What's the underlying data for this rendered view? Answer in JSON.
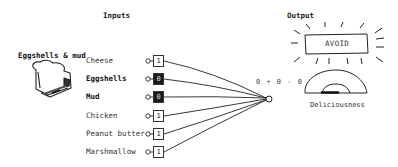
{
  "inputs_panel": {
    "heading": "Inputs",
    "sandwich_title": "Eggshells & mud",
    "sandwich_icon": "sandwich-icon",
    "items": [
      {
        "label": "Cheese",
        "value": "1",
        "active": false,
        "emphasized": false
      },
      {
        "label": "Eggshells",
        "value": "0",
        "active": true,
        "emphasized": true
      },
      {
        "label": "Mud",
        "value": "0",
        "active": true,
        "emphasized": true
      },
      {
        "label": "Chicken",
        "value": "1",
        "active": false,
        "emphasized": false
      },
      {
        "label": "Peanut butter",
        "value": "1",
        "active": false,
        "emphasized": false
      },
      {
        "label": "Marshmallow",
        "value": "1",
        "active": false,
        "emphasized": false
      }
    ]
  },
  "combiner": {
    "formula": "0 + 0 - 0"
  },
  "output_panel": {
    "heading": "Output",
    "verdict": "AVOID",
    "gauge_label": "Deliciousness",
    "gauge_level": "low"
  },
  "colors": {
    "ink": "#222222",
    "active_box": "#1a1a1a",
    "background": "#ffffff"
  }
}
